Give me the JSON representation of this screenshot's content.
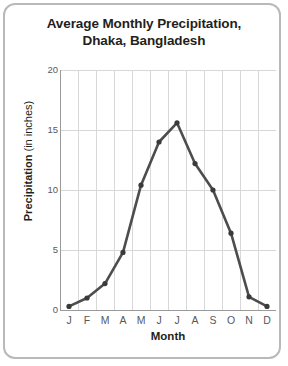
{
  "card": {
    "border_color": "#b9b9b9",
    "background": "#ffffff"
  },
  "title": {
    "line1": "Average Monthly Precipitation,",
    "line2": "Dhaka, Bangladesh"
  },
  "axis": {
    "y_label_bold": "Precipitation",
    "y_label_regular": " (in inches)",
    "x_label": "Month"
  },
  "chart_data": {
    "type": "line",
    "title": "Average Monthly Precipitation, Dhaka, Bangladesh",
    "xlabel": "Month",
    "ylabel": "Precipitation (in inches)",
    "categories": [
      "J",
      "F",
      "M",
      "A",
      "M",
      "J",
      "J",
      "A",
      "S",
      "O",
      "N",
      "D"
    ],
    "category_names": [
      "January",
      "February",
      "March",
      "April",
      "May",
      "June",
      "July",
      "August",
      "September",
      "October",
      "November",
      "December"
    ],
    "values": [
      0.3,
      1.0,
      2.2,
      4.8,
      10.4,
      14.0,
      15.6,
      12.2,
      10.0,
      6.4,
      1.1,
      0.3
    ],
    "ylim": [
      0,
      20
    ],
    "yticks": [
      0,
      5,
      10,
      15,
      20
    ],
    "ytick_labels": [
      "0",
      "5",
      "10",
      "15",
      "20"
    ],
    "grid": true,
    "grid_color": "#d8d8d8",
    "legend": null,
    "line_color": "#4d4d4d",
    "marker_color": "#3a3a3a",
    "marker": "circle",
    "axis_color": "#9a9a9a"
  }
}
